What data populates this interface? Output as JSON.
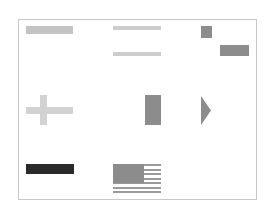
{
  "canvas": {
    "width": 275,
    "height": 217,
    "background": "#ffffff",
    "frame": {
      "x": 18,
      "y": 19,
      "width": 239,
      "height": 181,
      "border_color": "#c8c8c8"
    }
  },
  "colors": {
    "light_gray": "#c4c4c4",
    "lighter_gray": "#d0d0d0",
    "mid_gray": "#8c8c8c",
    "dark": "#2a2a2a",
    "cross": "#d2d2d2"
  },
  "shapes": [
    {
      "id": "bar-top-left",
      "type": "rect",
      "x": 26,
      "y": 26,
      "w": 47,
      "h": 8,
      "color": "#c4c4c4"
    },
    {
      "id": "thin-bar-1",
      "type": "rect",
      "x": 113,
      "y": 26,
      "w": 48,
      "h": 4,
      "color": "#cdcdcd"
    },
    {
      "id": "thin-bar-2",
      "type": "rect",
      "x": 113,
      "y": 52,
      "w": 48,
      "h": 4,
      "color": "#cdcdcd"
    },
    {
      "id": "small-square",
      "type": "rect",
      "x": 201,
      "y": 26,
      "w": 11,
      "h": 12,
      "color": "#8c8c8c"
    },
    {
      "id": "medium-rect",
      "type": "rect",
      "x": 220,
      "y": 45,
      "w": 29,
      "h": 11,
      "color": "#8c8c8c"
    },
    {
      "id": "cross-horizontal",
      "type": "rect",
      "x": 26,
      "y": 107,
      "w": 47,
      "h": 7,
      "color": "#d2d2d2"
    },
    {
      "id": "cross-vertical",
      "type": "rect",
      "x": 40,
      "y": 95,
      "w": 7,
      "h": 30,
      "color": "#d2d2d2"
    },
    {
      "id": "vertical-rect",
      "type": "rect",
      "x": 145,
      "y": 95,
      "w": 16,
      "h": 30,
      "color": "#8c8c8c"
    },
    {
      "id": "dark-bar",
      "type": "rect",
      "x": 26,
      "y": 164,
      "w": 48,
      "h": 10,
      "color": "#2a2a2a"
    }
  ],
  "triangle": {
    "id": "right-triangle",
    "x": 201,
    "y": 96,
    "w": 10,
    "h": 29,
    "color": "#8c8c8c",
    "direction": "right"
  },
  "flag": {
    "id": "flag",
    "x": 113,
    "y": 164,
    "w": 48,
    "h": 29,
    "canton": {
      "w": 31,
      "h": 19,
      "color": "#8c8c8c"
    },
    "stripe_color": "#9a9a9a",
    "stripe_count": 7,
    "stripe_height": 2,
    "stripe_gap": 2.5
  }
}
